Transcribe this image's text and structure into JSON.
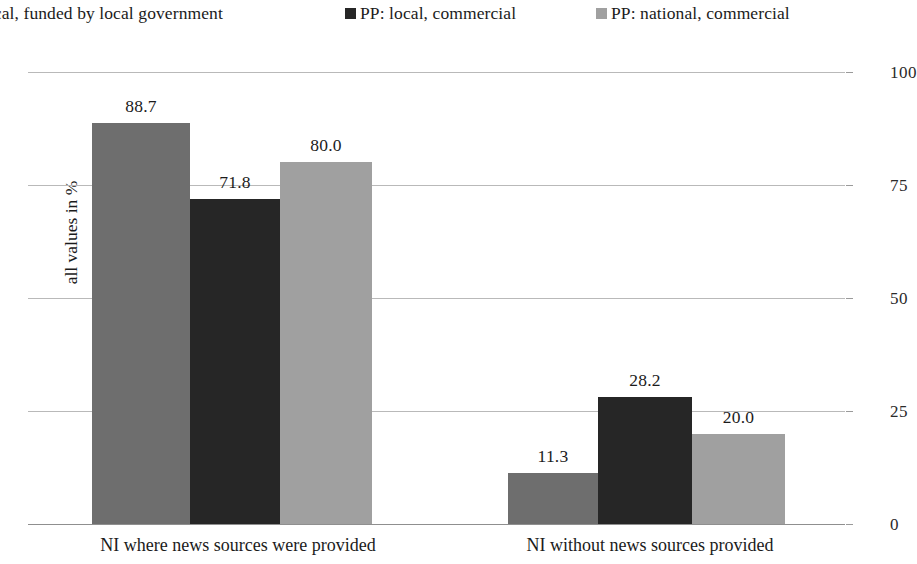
{
  "chart_data": {
    "type": "bar",
    "title": "",
    "subtitle": "",
    "xlabel": "",
    "ylabel": "all values in %",
    "ylim": [
      0,
      100
    ],
    "ytick_labels": [
      "100",
      "75",
      "50",
      "25",
      "0"
    ],
    "ytick_values": [
      100,
      75,
      50,
      25,
      0
    ],
    "grid": true,
    "legend_position": "top",
    "y_axis_side": "right",
    "categories": [
      "NI where news sources were provided",
      "NI without news sources provided"
    ],
    "series": [
      {
        "name": "local, funded by local government",
        "color": "#6e6e6e",
        "values": [
          88.7,
          20.0
        ],
        "value_labels": [
          "88.7",
          "11.3"
        ]
      },
      {
        "name": "PP: local, commercial",
        "color": "#262626",
        "values": [
          71.8,
          28.2
        ],
        "value_labels": [
          "71.8",
          "28.2"
        ]
      },
      {
        "name": "PP: national, commercial",
        "color": "#a0a0a0",
        "values": [
          80.0,
          20.0
        ],
        "value_labels": [
          "80.0",
          "20.0"
        ]
      }
    ],
    "bars": [
      {
        "group": 0,
        "series": 0,
        "value": 88.7,
        "label": "88.7",
        "color": "#6e6e6e"
      },
      {
        "group": 0,
        "series": 1,
        "value": 71.8,
        "label": "71.8",
        "color": "#262626"
      },
      {
        "group": 0,
        "series": 2,
        "value": 80.0,
        "label": "80.0",
        "color": "#a0a0a0"
      },
      {
        "group": 1,
        "series": 0,
        "value": 11.3,
        "label": "11.3",
        "color": "#6e6e6e"
      },
      {
        "group": 1,
        "series": 1,
        "value": 28.2,
        "label": "28.2",
        "color": "#262626"
      },
      {
        "group": 1,
        "series": 2,
        "value": 20.0,
        "label": "20.0",
        "color": "#a0a0a0"
      }
    ]
  },
  "legend": {
    "items": [
      {
        "label": "local, funded by local government",
        "color": "#6e6e6e",
        "marker_visible": false
      },
      {
        "label": "PP: local, commercial",
        "color": "#262626",
        "marker_visible": true
      },
      {
        "label": "PP: national, commercial",
        "color": "#a0a0a0",
        "marker_visible": true
      }
    ]
  },
  "axes": {
    "y_title": "all values in %",
    "y_ticks": [
      "100",
      "75",
      "50",
      "25",
      "0"
    ],
    "x_categories": [
      "NI where news sources were provided",
      "NI without news sources provided"
    ]
  },
  "colors": {
    "series_1": "#6e6e6e",
    "series_2": "#262626",
    "series_3": "#a0a0a0",
    "gridline": "#b9b9b9",
    "axis": "#8f8f8f",
    "text": "#1b1b1b",
    "background": "#ffffff"
  }
}
